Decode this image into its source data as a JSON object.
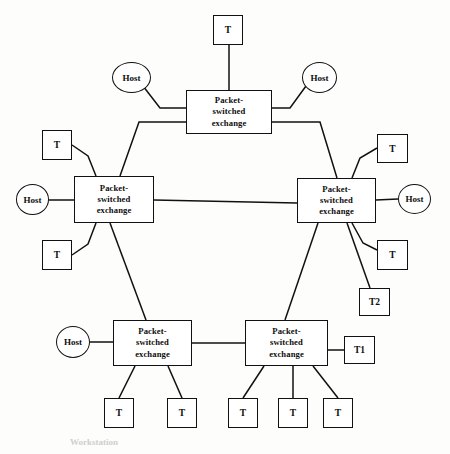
{
  "figure": {
    "caption": "Workstation",
    "stroke_color": "#111111",
    "fill_color": "#ffffff",
    "background_color": "#fdfdfc",
    "text_color": "#0d0d0d"
  },
  "labels": {
    "exchange_line1": "Packet-",
    "exchange_line2": "switched",
    "exchange_line3": "exchange",
    "terminal": "T",
    "terminal_1": "T1",
    "terminal_2": "T2",
    "host": "Host"
  },
  "nodes": [
    {
      "id": "exchange-top",
      "kind": "exchange",
      "label": "Packet-switched exchange",
      "x": 186,
      "y": 90,
      "w": 86,
      "h": 44
    },
    {
      "id": "exchange-left",
      "kind": "exchange",
      "label": "Packet-switched exchange",
      "x": 74,
      "y": 176,
      "w": 80,
      "h": 47
    },
    {
      "id": "exchange-right",
      "kind": "exchange",
      "label": "Packet-switched exchange",
      "x": 297,
      "y": 178,
      "w": 79,
      "h": 45
    },
    {
      "id": "exchange-bottom-left",
      "kind": "exchange",
      "label": "Packet-switched exchange",
      "x": 113,
      "y": 320,
      "w": 79,
      "h": 46
    },
    {
      "id": "exchange-bottom-right",
      "kind": "exchange",
      "label": "Packet-switched exchange",
      "x": 245,
      "y": 320,
      "w": 83,
      "h": 46
    },
    {
      "id": "host-top-left",
      "kind": "host",
      "label": "Host",
      "x": 112,
      "y": 62,
      "w": 39,
      "h": 31
    },
    {
      "id": "host-top-right",
      "kind": "host",
      "label": "Host",
      "x": 302,
      "y": 62,
      "w": 35,
      "h": 31
    },
    {
      "id": "host-left",
      "kind": "host",
      "label": "Host",
      "x": 16,
      "y": 184,
      "w": 33,
      "h": 31
    },
    {
      "id": "host-right",
      "kind": "host",
      "label": "Host",
      "x": 398,
      "y": 184,
      "w": 33,
      "h": 30
    },
    {
      "id": "host-bottom-left",
      "kind": "host",
      "label": "Host",
      "x": 56,
      "y": 326,
      "w": 34,
      "h": 32
    },
    {
      "id": "terminal-top",
      "kind": "terminal",
      "label": "T",
      "x": 213,
      "y": 15,
      "w": 30,
      "h": 30
    },
    {
      "id": "terminal-left-upper",
      "kind": "terminal",
      "label": "T",
      "x": 42,
      "y": 130,
      "w": 30,
      "h": 30
    },
    {
      "id": "terminal-left-lower",
      "kind": "terminal",
      "label": "T",
      "x": 42,
      "y": 240,
      "w": 30,
      "h": 30
    },
    {
      "id": "terminal-right-upper",
      "kind": "terminal",
      "label": "T",
      "x": 377,
      "y": 134,
      "w": 31,
      "h": 29
    },
    {
      "id": "terminal-right-lower",
      "kind": "terminal",
      "label": "T",
      "x": 377,
      "y": 240,
      "w": 31,
      "h": 30
    },
    {
      "id": "terminal-t2",
      "kind": "terminal",
      "label": "T2",
      "x": 359,
      "y": 288,
      "w": 31,
      "h": 28
    },
    {
      "id": "terminal-t1",
      "kind": "terminal",
      "label": "T1",
      "x": 344,
      "y": 336,
      "w": 31,
      "h": 28
    },
    {
      "id": "terminal-bl-1",
      "kind": "terminal",
      "label": "T",
      "x": 104,
      "y": 398,
      "w": 30,
      "h": 30
    },
    {
      "id": "terminal-bl-2",
      "kind": "terminal",
      "label": "T",
      "x": 167,
      "y": 398,
      "w": 30,
      "h": 30
    },
    {
      "id": "terminal-br-1",
      "kind": "terminal",
      "label": "T",
      "x": 228,
      "y": 398,
      "w": 30,
      "h": 30
    },
    {
      "id": "terminal-br-2",
      "kind": "terminal",
      "label": "T",
      "x": 278,
      "y": 398,
      "w": 30,
      "h": 30
    },
    {
      "id": "terminal-br-3",
      "kind": "terminal",
      "label": "T",
      "x": 323,
      "y": 398,
      "w": 30,
      "h": 30
    }
  ],
  "links": [
    {
      "id": "link-top-terminal",
      "points": "229,45 229,90"
    },
    {
      "id": "link-top-host-left",
      "points": "143,86 160,108 186,108"
    },
    {
      "id": "link-top-host-right",
      "points": "306,86 290,108 272,108"
    },
    {
      "id": "link-top-to-left-trunk",
      "points": "186,122 139,122 120,176"
    },
    {
      "id": "link-top-to-right-trunk",
      "points": "272,122 320,122 337,178"
    },
    {
      "id": "link-left-to-right-trunk",
      "points": "154,200 297,203"
    },
    {
      "id": "link-left-host",
      "points": "49,200 74,200"
    },
    {
      "id": "link-left-terminal-upper",
      "points": "72,145 88,156 96,176"
    },
    {
      "id": "link-left-terminal-lower",
      "points": "72,255 88,244 96,223"
    },
    {
      "id": "link-right-host",
      "points": "376,200 398,199"
    },
    {
      "id": "link-right-terminal-upper",
      "points": "377,148 360,158 352,178"
    },
    {
      "id": "link-right-terminal-lower",
      "points": "377,250 363,243 352,223"
    },
    {
      "id": "link-right-to-t2",
      "points": "347,223 370,288"
    },
    {
      "id": "link-right-to-bottom-right",
      "points": "318,223 285,320"
    },
    {
      "id": "link-left-to-bottom-left",
      "points": "110,223 146,320"
    },
    {
      "id": "link-bl-host",
      "points": "90,342 113,342"
    },
    {
      "id": "link-bl-to-br",
      "points": "192,343 245,343"
    },
    {
      "id": "link-bl-terminal-1",
      "points": "135,366 119,398"
    },
    {
      "id": "link-bl-terminal-2",
      "points": "168,366 182,398"
    },
    {
      "id": "link-br-terminal-1",
      "points": "264,366 243,398"
    },
    {
      "id": "link-br-terminal-2",
      "points": "293,366 293,398"
    },
    {
      "id": "link-br-terminal-3",
      "points": "313,366 338,398"
    },
    {
      "id": "link-br-to-t1",
      "points": "328,350 344,350"
    }
  ]
}
